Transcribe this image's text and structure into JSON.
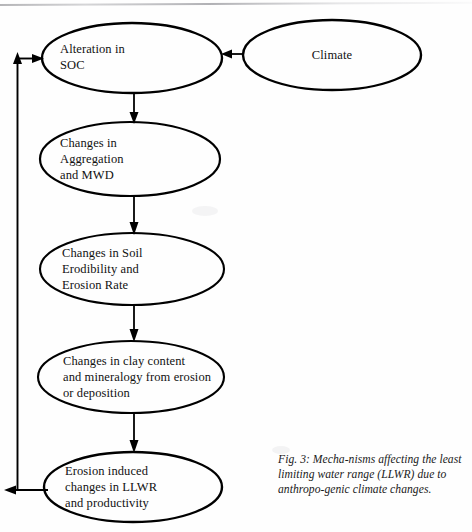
{
  "figure": {
    "caption": "Fig. 3:  Mecha-nisms affecting the least limiting water range (LLWR) due to anthropo-genic climate changes.",
    "stroke_color": "#000000",
    "text_color": "#111111",
    "background_color": "#fefefe"
  },
  "nodes": [
    {
      "id": "alteration-soc",
      "label": "Alteration in\nSOC",
      "align": "left",
      "cx": 132,
      "cy": 58,
      "rx": 90,
      "ry": 35
    },
    {
      "id": "climate",
      "label": "Climate",
      "align": "center",
      "cx": 332,
      "cy": 55,
      "rx": 89,
      "ry": 35
    },
    {
      "id": "changes-aggregation",
      "label": "Changes in\nAggregation\nand MWD",
      "align": "left",
      "cx": 130,
      "cy": 159,
      "rx": 90,
      "ry": 37
    },
    {
      "id": "changes-soil-erodibility",
      "label": "Changes in Soil\nErodibility and\nErosion Rate",
      "align": "left",
      "cx": 132,
      "cy": 269,
      "rx": 92,
      "ry": 36
    },
    {
      "id": "changes-clay-content",
      "label": "Changes in clay content\nand mineralogy from erosion\nor deposition",
      "align": "left",
      "cx": 131,
      "cy": 377,
      "rx": 93,
      "ry": 36
    },
    {
      "id": "erosion-induced-llwr",
      "label": "Erosion induced\nchanges in LLWR\nand productivity",
      "align": "left",
      "cx": 133,
      "cy": 487,
      "rx": 89,
      "ry": 35
    }
  ],
  "edges": [
    {
      "id": "climate-to-soc",
      "from": "climate",
      "to": "alteration-soc",
      "direction": "left"
    },
    {
      "id": "soc-to-aggregation",
      "from": "alteration-soc",
      "to": "changes-aggregation",
      "direction": "down"
    },
    {
      "id": "aggregation-to-erodibility",
      "from": "changes-aggregation",
      "to": "changes-soil-erodibility",
      "direction": "down"
    },
    {
      "id": "erodibility-to-clay",
      "from": "changes-soil-erodibility",
      "to": "changes-clay-content",
      "direction": "down"
    },
    {
      "id": "clay-to-llwr",
      "from": "changes-clay-content",
      "to": "erosion-induced-llwr",
      "direction": "down"
    },
    {
      "id": "llwr-feedback-to-soc",
      "from": "erosion-induced-llwr",
      "to": "alteration-soc",
      "direction": "feedback-loop"
    }
  ]
}
